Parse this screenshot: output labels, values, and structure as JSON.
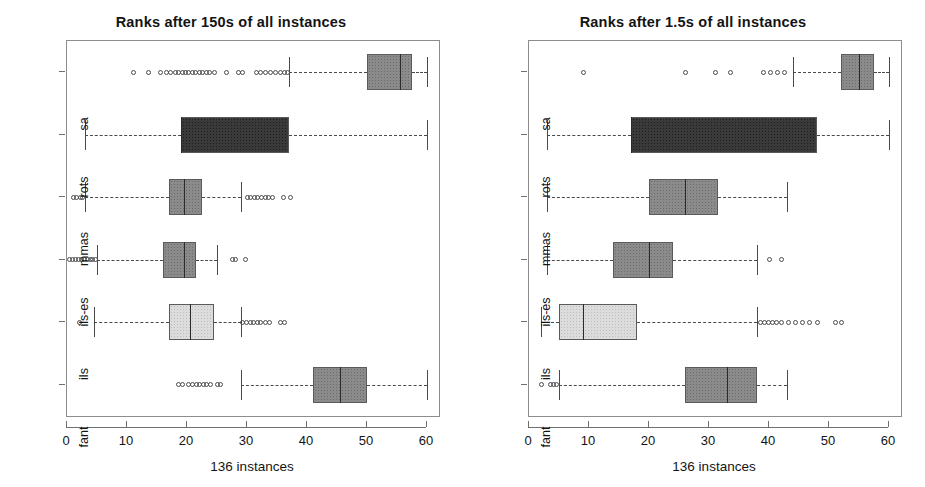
{
  "figure": {
    "width": 925,
    "height": 487,
    "background": "#ffffff"
  },
  "chart_data": [
    {
      "type": "box",
      "panel_index": 0,
      "title": "Ranks after 150s of all instances",
      "xlabel": "136 instances",
      "ylabel": "",
      "orientation": "horizontal",
      "xlim": [
        0,
        62
      ],
      "xticks": [
        0,
        10,
        20,
        30,
        40,
        50,
        60
      ],
      "xticklabels": [
        "0",
        "10",
        "20",
        "30",
        "40",
        "50",
        "60"
      ],
      "grid": false,
      "legend": "none",
      "n_instances": 136,
      "categories": [
        "fant",
        "ils",
        "ils-es",
        "mmas",
        "rots",
        "sa"
      ],
      "boxes": [
        {
          "label": "sa",
          "fill": "#8b8b8b",
          "whisker_low": 37.0,
          "q1": 50.0,
          "median": 55.5,
          "q3": 57.5,
          "whisker_high": 60.0,
          "outliers": [
            11.0,
            13.5,
            15.5,
            16.5,
            17.3,
            18.0,
            18.6,
            19.2,
            19.8,
            20.3,
            20.9,
            21.4,
            22.0,
            22.6,
            23.2,
            23.8,
            24.5,
            26.5,
            28.6,
            29.2,
            31.5,
            32.3,
            33.1,
            33.9,
            34.7,
            35.5,
            36.2,
            36.8
          ]
        },
        {
          "label": "rots",
          "fill": "#3a3a3a",
          "whisker_low": 3.0,
          "q1": 19.0,
          "median": 19.0,
          "q3": 37.0,
          "whisker_high": 60.0,
          "outliers": []
        },
        {
          "label": "mmas",
          "fill": "#8b8b8b",
          "whisker_low": 3.0,
          "q1": 17.0,
          "median": 19.5,
          "q3": 22.5,
          "whisker_high": 29.0,
          "outliers": [
            1.0,
            1.6,
            2.2,
            2.6,
            30.0,
            30.6,
            31.2,
            31.8,
            32.4,
            33.0,
            33.6,
            34.2,
            36.0,
            37.3
          ]
        },
        {
          "label": "ils-es",
          "fill": "#8b8b8b",
          "whisker_low": 5.0,
          "q1": 16.0,
          "median": 19.5,
          "q3": 21.5,
          "whisker_high": 25.0,
          "outliers": [
            0.4,
            0.9,
            1.4,
            1.9,
            2.4,
            2.9,
            3.4,
            3.9,
            4.3,
            4.7,
            27.5,
            28.1,
            29.8
          ]
        },
        {
          "label": "ils",
          "fill": "#dcdcdc",
          "whisker_low": 4.5,
          "q1": 17.0,
          "median": 20.5,
          "q3": 24.5,
          "whisker_high": 29.0,
          "outliers": [
            2.0,
            29.3,
            29.9,
            30.5,
            31.1,
            31.7,
            32.3,
            33.0,
            33.8,
            35.5,
            36.3
          ]
        },
        {
          "label": "fant",
          "fill": "#8b8b8b",
          "whisker_low": 29.0,
          "q1": 41.0,
          "median": 45.5,
          "q3": 50.0,
          "whisker_high": 60.0,
          "outliers": [
            18.5,
            19.2,
            20.2,
            20.9,
            21.5,
            22.1,
            22.7,
            23.3,
            23.9,
            25.0,
            25.6
          ]
        }
      ]
    },
    {
      "type": "box",
      "panel_index": 1,
      "title": "Ranks after 1.5s of all instances",
      "xlabel": "136 instances",
      "ylabel": "",
      "orientation": "horizontal",
      "xlim": [
        0,
        62
      ],
      "xticks": [
        0,
        10,
        20,
        30,
        40,
        50,
        60
      ],
      "xticklabels": [
        "0",
        "10",
        "20",
        "30",
        "40",
        "50",
        "60"
      ],
      "grid": false,
      "legend": "none",
      "n_instances": 136,
      "categories": [
        "fant",
        "ils",
        "ils-es",
        "mmas",
        "rots",
        "sa"
      ],
      "boxes": [
        {
          "label": "sa",
          "fill": "#8b8b8b",
          "whisker_low": 44.0,
          "q1": 52.0,
          "median": 55.0,
          "q3": 57.5,
          "whisker_high": 60.0,
          "outliers": [
            9.0,
            26.0,
            31.0,
            33.5,
            39.0,
            40.2,
            41.4,
            42.6
          ]
        },
        {
          "label": "rots",
          "fill": "#3a3a3a",
          "whisker_low": 3.0,
          "q1": 17.0,
          "median": 17.0,
          "q3": 48.0,
          "whisker_high": 60.0,
          "outliers": []
        },
        {
          "label": "mmas",
          "fill": "#8b8b8b",
          "whisker_low": 3.0,
          "q1": 20.0,
          "median": 26.0,
          "q3": 31.5,
          "whisker_high": 43.0,
          "outliers": []
        },
        {
          "label": "ils-es",
          "fill": "#8b8b8b",
          "whisker_low": 3.0,
          "q1": 14.0,
          "median": 20.0,
          "q3": 24.0,
          "whisker_high": 38.0,
          "outliers": [
            40.0,
            42.0
          ]
        },
        {
          "label": "ils",
          "fill": "#dcdcdc",
          "whisker_low": 2.0,
          "q1": 5.0,
          "median": 9.0,
          "q3": 18.0,
          "whisker_high": 38.0,
          "outliers": [
            38.5,
            39.2,
            39.9,
            40.6,
            41.3,
            42.0,
            43.2,
            44.4,
            45.6,
            46.8,
            48.0,
            51.0,
            52.0
          ]
        },
        {
          "label": "fant",
          "fill": "#8b8b8b",
          "whisker_low": 5.0,
          "q1": 26.0,
          "median": 33.0,
          "q3": 38.0,
          "whisker_high": 43.0,
          "outliers": [
            2.0,
            3.6,
            4.1,
            4.6
          ]
        }
      ]
    }
  ]
}
